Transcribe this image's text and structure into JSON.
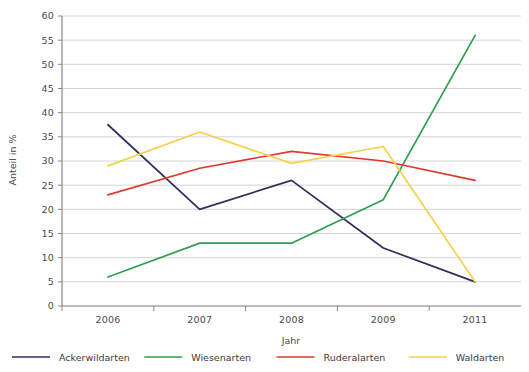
{
  "chart_data": {
    "type": "line",
    "title": "",
    "subtitle": "",
    "xlabel": "Jahr",
    "ylabel": "Anteil in %",
    "categories": [
      "2006",
      "2007",
      "2008",
      "2009",
      "2011"
    ],
    "x": [
      2006,
      2007,
      2008,
      2009,
      2011
    ],
    "ylim": [
      0,
      60
    ],
    "y_ticks": [
      0,
      5,
      10,
      15,
      20,
      25,
      30,
      35,
      40,
      45,
      50,
      55,
      60
    ],
    "grid": true,
    "legend_position": "bottom",
    "series": [
      {
        "name": "Ackerwildarten",
        "color": "#2d2f5e",
        "values": [
          37.5,
          20,
          26,
          12,
          5
        ]
      },
      {
        "name": "Wiesenarten",
        "color": "#2f9e4f",
        "values": [
          6,
          13,
          13,
          22,
          56
        ]
      },
      {
        "name": "Ruderalarten",
        "color": "#e0392e",
        "values": [
          23,
          28.5,
          32,
          30,
          26
        ]
      },
      {
        "name": "Waldarten",
        "color": "#f2d24b",
        "values": [
          29,
          36,
          29.5,
          33,
          5
        ]
      }
    ]
  },
  "axes": {
    "y_tick_labels": [
      "0",
      "5",
      "10",
      "15",
      "20",
      "25",
      "30",
      "35",
      "40",
      "45",
      "50",
      "55",
      "60"
    ],
    "x_tick_labels": [
      "2006",
      "2007",
      "2008",
      "2009",
      "2011"
    ],
    "x_axis_title": "Jahr",
    "y_axis_title": "Anteil in %"
  },
  "legend": {
    "items": [
      {
        "label": "Ackerwildarten",
        "color": "#2d2f5e"
      },
      {
        "label": "Wiesenarten",
        "color": "#2f9e4f"
      },
      {
        "label": "Ruderalarten",
        "color": "#e0392e"
      },
      {
        "label": "Waldarten",
        "color": "#f2d24b"
      }
    ]
  },
  "colors": {
    "gridline": "#c9c9c9",
    "axis": "#7d7d7d",
    "text": "#3b3b3b",
    "background": "#ffffff"
  }
}
